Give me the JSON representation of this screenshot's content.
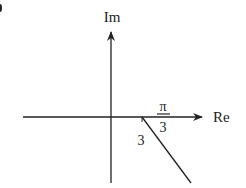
{
  "diagram": {
    "type": "complex-plane",
    "axes": {
      "real_label": "Re",
      "imag_label": "Im"
    },
    "ray": {
      "start_label": "3",
      "angle_label_num": "π",
      "angle_label_den": "3",
      "description": "ray starting at 3 on the real axis at angle -π/3"
    },
    "colors": {
      "stroke": "#222222",
      "background": "#ffffff"
    }
  }
}
